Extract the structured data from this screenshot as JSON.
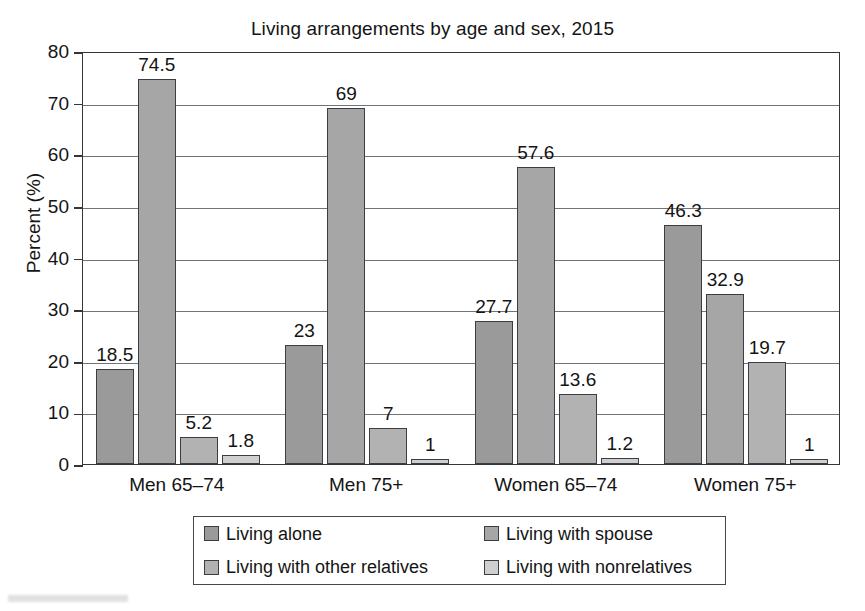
{
  "chart_data": {
    "type": "bar",
    "title": "Living arrangements by age and sex, 2015",
    "xlabel": "",
    "ylabel": "Percent (%)",
    "ylim": [
      0,
      80
    ],
    "ytick_step": 10,
    "yticks": [
      "0",
      "10",
      "20",
      "30",
      "40",
      "50",
      "60",
      "70",
      "80"
    ],
    "grid": "horizontal",
    "legend_position": "bottom",
    "categories": [
      "Men 65–74",
      "Men 75+",
      "Women 65–74",
      "Women 75+"
    ],
    "series": [
      {
        "name": "Living alone",
        "color": "#9a9a9a",
        "values": [
          18.5,
          23,
          27.7,
          46.3
        ],
        "labels": [
          "18.5",
          "23",
          "27.7",
          "46.3"
        ]
      },
      {
        "name": "Living with spouse",
        "color": "#a6a6a6",
        "values": [
          74.5,
          69,
          57.6,
          32.9
        ],
        "labels": [
          "74.5",
          "69",
          "57.6",
          "32.9"
        ]
      },
      {
        "name": "Living with other relatives",
        "color": "#b2b2b2",
        "values": [
          5.2,
          7,
          13.6,
          19.7
        ],
        "labels": [
          "5.2",
          "7",
          "13.6",
          "19.7"
        ]
      },
      {
        "name": "Living with nonrelatives",
        "color": "#cfcfcf",
        "values": [
          1.8,
          1,
          1.2,
          1
        ],
        "labels": [
          "1.8",
          "1",
          "1.2",
          "1"
        ]
      }
    ]
  },
  "axes": {
    "y_label": "Percent (%)",
    "y_ticks": [
      "80",
      "70",
      "60",
      "50",
      "40",
      "30",
      "20",
      "10",
      "0"
    ]
  },
  "legend": {
    "items": [
      {
        "label": "Living alone",
        "color": "#9a9a9a"
      },
      {
        "label": "Living with spouse",
        "color": "#a6a6a6"
      },
      {
        "label": "Living with other relatives",
        "color": "#b2b2b2"
      },
      {
        "label": "Living with nonrelatives",
        "color": "#cfcfcf"
      }
    ]
  },
  "title": "Living arrangements by age and sex, 2015"
}
